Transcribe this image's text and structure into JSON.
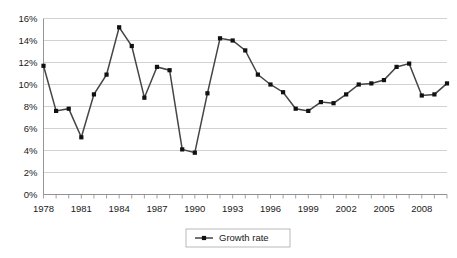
{
  "chart_data": {
    "type": "line",
    "title": "",
    "subtitle": "",
    "xlabel": "",
    "ylabel": "",
    "grid": true,
    "legend_position": "bottom",
    "ylim": [
      0,
      16
    ],
    "ytick_values": [
      0,
      2,
      4,
      6,
      8,
      10,
      12,
      14,
      16
    ],
    "ytick_labels": [
      "0%",
      "2%",
      "4%",
      "6%",
      "8%",
      "10%",
      "12%",
      "14%",
      "16%"
    ],
    "xlim": [
      1978,
      2010
    ],
    "xtick_labels": [
      "1978",
      "1981",
      "1984",
      "1987",
      "1990",
      "1993",
      "1996",
      "1999",
      "2002",
      "2005",
      "2008"
    ],
    "xtick_values": [
      1978,
      1981,
      1984,
      1987,
      1990,
      1993,
      1996,
      1999,
      2002,
      2005,
      2008
    ],
    "x": [
      1978,
      1979,
      1980,
      1981,
      1982,
      1983,
      1984,
      1985,
      1986,
      1987,
      1988,
      1989,
      1990,
      1991,
      1992,
      1993,
      1994,
      1995,
      1996,
      1997,
      1998,
      1999,
      2000,
      2001,
      2002,
      2003,
      2004,
      2005,
      2006,
      2007,
      2008,
      2009,
      2010
    ],
    "series": [
      {
        "name": "Growth rate",
        "color": "#454545",
        "marker": "square",
        "marker_color": "#111111",
        "values": [
          11.7,
          7.6,
          7.8,
          5.2,
          9.1,
          10.9,
          15.2,
          13.5,
          8.8,
          11.6,
          11.3,
          4.1,
          3.8,
          9.2,
          14.2,
          14.0,
          13.1,
          10.9,
          10.0,
          9.3,
          7.8,
          7.6,
          8.4,
          8.3,
          9.1,
          10.0,
          10.1,
          10.4,
          11.6,
          11.9,
          9.0,
          9.1,
          10.1
        ]
      }
    ]
  },
  "legend": {
    "entries": [
      {
        "label": "Growth rate"
      }
    ]
  }
}
